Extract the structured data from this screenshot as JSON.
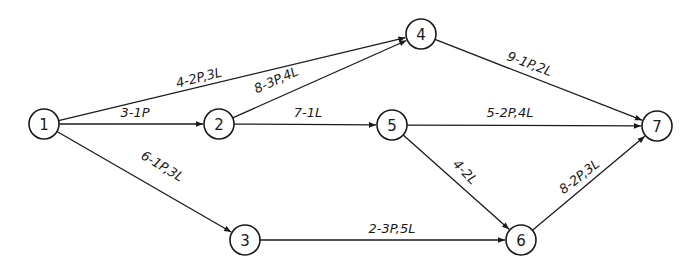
{
  "diagram": {
    "type": "activity-network",
    "colors": {
      "stroke": "#1a1a1a",
      "background": "#ffffff"
    },
    "nodes": [
      {
        "id": "1",
        "label": "1",
        "x": 44,
        "y": 124
      },
      {
        "id": "2",
        "label": "2",
        "x": 219,
        "y": 124
      },
      {
        "id": "3",
        "label": "3",
        "x": 245,
        "y": 240
      },
      {
        "id": "4",
        "label": "4",
        "x": 421,
        "y": 34
      },
      {
        "id": "5",
        "label": "5",
        "x": 392,
        "y": 125
      },
      {
        "id": "6",
        "label": "6",
        "x": 521,
        "y": 240
      },
      {
        "id": "7",
        "label": "7",
        "x": 657,
        "y": 126
      }
    ],
    "edges": [
      {
        "from": "1",
        "to": "4",
        "label": "4-2P,3L",
        "lx": 200,
        "ly": 82,
        "angle": -14.3
      },
      {
        "from": "1",
        "to": "2",
        "label": "3-1P",
        "lx": 135,
        "ly": 117,
        "angle": 0
      },
      {
        "from": "1",
        "to": "3",
        "label": "6-1P,3L",
        "lx": 160,
        "ly": 170,
        "angle": 31
      },
      {
        "from": "2",
        "to": "4",
        "label": "8-3P,4L",
        "lx": 278,
        "ly": 84,
        "angle": -24
      },
      {
        "from": "2",
        "to": "5",
        "label": "7-1L",
        "lx": 308,
        "ly": 117,
        "angle": 0
      },
      {
        "from": "3",
        "to": "6",
        "label": "2-3P,5L",
        "lx": 392,
        "ly": 233,
        "angle": 0
      },
      {
        "from": "4",
        "to": "7",
        "label": "9-1P,2L",
        "lx": 528,
        "ly": 68,
        "angle": 20.5
      },
      {
        "from": "5",
        "to": "7",
        "label": "5-2P,4L",
        "lx": 510,
        "ly": 117,
        "angle": 0
      },
      {
        "from": "5",
        "to": "6",
        "label": "4-2L",
        "lx": 462,
        "ly": 175,
        "angle": 46
      },
      {
        "from": "6",
        "to": "7",
        "label": "8-2P,3L",
        "lx": 582,
        "ly": 180,
        "angle": -38
      }
    ]
  }
}
